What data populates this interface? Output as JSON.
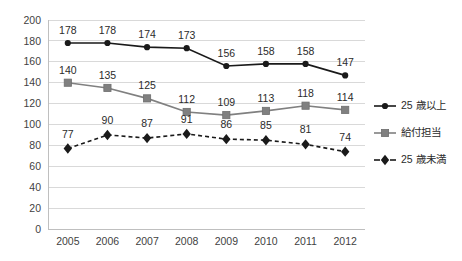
{
  "chart_data": {
    "type": "line",
    "title": "",
    "subtitle": "",
    "xlabel": "",
    "ylabel": "",
    "categories": [
      "2005",
      "2006",
      "2007",
      "2008",
      "2009",
      "2010",
      "2011",
      "2012"
    ],
    "ylim": [
      0,
      200
    ],
    "ytick_step": 20,
    "ytick_labels": [
      "200",
      "180",
      "160",
      "140",
      "120",
      "100",
      "80",
      "60",
      "40",
      "20",
      "0"
    ],
    "grid": "horizontal",
    "legend_position": "right",
    "data_labels": true,
    "series": [
      {
        "name": "25 歳以上",
        "values": [
          178,
          178,
          174,
          173,
          156,
          158,
          158,
          147
        ],
        "color": "#1a1a1a",
        "marker": "circle",
        "line_style": "solid"
      },
      {
        "name": "給付担当",
        "values": [
          140,
          135,
          125,
          112,
          109,
          113,
          118,
          114
        ],
        "color": "#808080",
        "marker": "square",
        "line_style": "solid"
      },
      {
        "name": "25 歳未満",
        "values": [
          77,
          90,
          87,
          91,
          86,
          85,
          81,
          74
        ],
        "color": "#1a1a1a",
        "marker": "diamond",
        "line_style": "dashed"
      }
    ]
  },
  "legend": {
    "entries": [
      {
        "label": "25 歳以上"
      },
      {
        "label": "給付担当"
      },
      {
        "label": "25 歳未満"
      }
    ]
  },
  "axis": {
    "y_ticks": [
      "200",
      "180",
      "160",
      "140",
      "120",
      "100",
      "80",
      "60",
      "40",
      "20",
      "0"
    ],
    "x_ticks": [
      "2005",
      "2006",
      "2007",
      "2008",
      "2009",
      "2010",
      "2011",
      "2012"
    ]
  },
  "labels": {
    "series_a": [
      "178",
      "178",
      "174",
      "173",
      "156",
      "158",
      "158",
      "147"
    ],
    "series_b": [
      "140",
      "135",
      "125",
      "112",
      "109",
      "113",
      "118",
      "114"
    ],
    "series_c": [
      "77",
      "90",
      "87",
      "91",
      "86",
      "85",
      "81",
      "74"
    ]
  }
}
